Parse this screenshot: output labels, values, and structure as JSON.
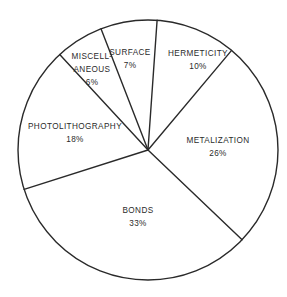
{
  "chart_data": {
    "type": "pie",
    "title": "",
    "start_angle_deg": 4,
    "direction": "clockwise",
    "center": [
      148,
      150
    ],
    "radius": 130,
    "colors": {
      "stroke": "#2a2a2a",
      "fill": "#ffffff",
      "text": "#2b2b2b"
    },
    "slices": [
      {
        "label_lines": [
          "HERMETICITY"
        ],
        "value": 10,
        "value_label": "10%",
        "label_pos": [
          198,
          56
        ]
      },
      {
        "label_lines": [
          "METALIZATION"
        ],
        "value": 26,
        "value_label": "26%",
        "label_pos": [
          218,
          143
        ]
      },
      {
        "label_lines": [
          "BONDS"
        ],
        "value": 33,
        "value_label": "33%",
        "label_pos": [
          138,
          213
        ]
      },
      {
        "label_lines": [
          "PHOTOLITHOGRAPHY"
        ],
        "value": 18,
        "value_label": "18%",
        "label_pos": [
          75,
          129
        ]
      },
      {
        "label_lines": [
          "MISCELL-",
          "ANEOUS"
        ],
        "value": 6,
        "value_label": "6%",
        "label_pos": [
          92,
          59
        ]
      },
      {
        "label_lines": [
          "SURFACE"
        ],
        "value": 7,
        "value_label": "7%",
        "label_pos": [
          130,
          55
        ]
      }
    ],
    "categories": [
      "HERMETICITY",
      "METALIZATION",
      "BONDS",
      "PHOTOLITHOGRAPHY",
      "MISCELLANEOUS",
      "SURFACE"
    ],
    "values": [
      10,
      26,
      33,
      18,
      6,
      7
    ],
    "legend": "none (labels inside slices)"
  }
}
